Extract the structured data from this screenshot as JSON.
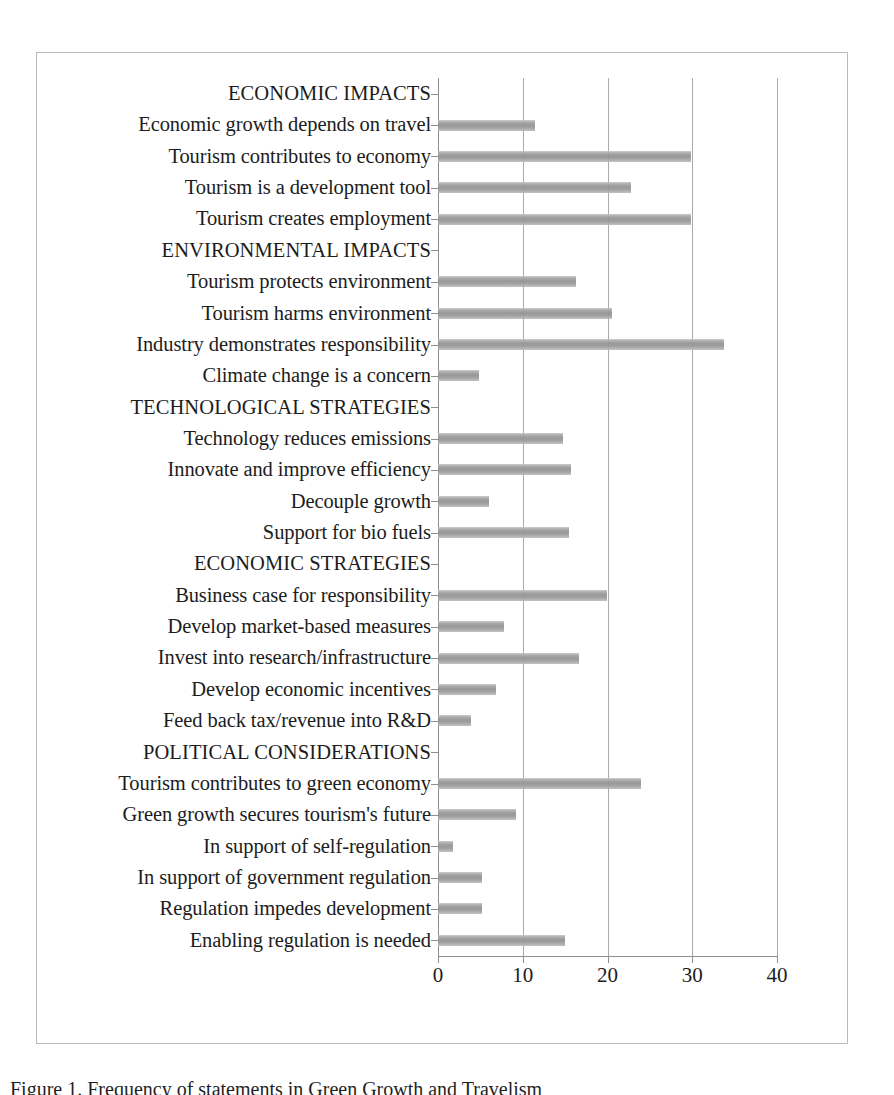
{
  "figure": {
    "caption": "Figure 1. Frequency of statements in Green Growth and Travelism"
  },
  "chart_data": {
    "type": "bar",
    "orientation": "horizontal",
    "title": "",
    "xlabel": "",
    "ylabel": "",
    "xlim": [
      0,
      40
    ],
    "xticks": [
      0,
      10,
      20,
      30,
      40
    ],
    "xtick_labels": [
      "0",
      "10",
      "20",
      "30",
      "40"
    ],
    "grid": true,
    "grid_axis": "x",
    "legend": false,
    "bar_color": "#999999",
    "categories": [
      "ECONOMIC IMPACTS",
      "Economic growth depends on travel",
      "Tourism contributes to economy",
      "Tourism is a development tool",
      "Tourism creates employment",
      "ENVIRONMENTAL IMPACTS",
      "Tourism protects environment",
      "Tourism harms environment",
      "Industry demonstrates responsibility",
      "Climate change is a concern",
      "TECHNOLOGICAL STRATEGIES",
      "Technology reduces emissions",
      "Innovate and improve efficiency",
      "Decouple growth",
      "Support for bio fuels",
      "ECONOMIC STRATEGIES",
      "Business case for responsibility",
      "Develop market-based measures",
      "Invest into research/infrastructure",
      "Develop economic incentives",
      "Feed back tax/revenue into R&D",
      "POLITICAL CONSIDERATIONS",
      "Tourism contributes to green economy",
      "Green growth secures tourism's future",
      "In support of self-regulation",
      "In support of government regulation",
      "Regulation impedes development",
      "Enabling regulation is needed"
    ],
    "values": [
      0,
      11.5,
      29.8,
      22.8,
      29.8,
      0,
      16.3,
      20.5,
      33.8,
      4.8,
      0,
      14.8,
      15.7,
      6.0,
      15.5,
      0,
      19.9,
      7.8,
      16.6,
      6.9,
      3.9,
      0,
      24.0,
      9.2,
      1.8,
      5.2,
      5.2,
      15.0
    ],
    "is_group_header": [
      true,
      false,
      false,
      false,
      false,
      true,
      false,
      false,
      false,
      false,
      true,
      false,
      false,
      false,
      false,
      true,
      false,
      false,
      false,
      false,
      false,
      true,
      false,
      false,
      false,
      false,
      false,
      false
    ],
    "groups": [
      {
        "name": "ECONOMIC IMPACTS",
        "items": [
          {
            "label": "Economic growth depends on travel",
            "value": 11.5
          },
          {
            "label": "Tourism contributes to economy",
            "value": 29.8
          },
          {
            "label": "Tourism is a development tool",
            "value": 22.8
          },
          {
            "label": "Tourism creates employment",
            "value": 29.8
          }
        ]
      },
      {
        "name": "ENVIRONMENTAL IMPACTS",
        "items": [
          {
            "label": "Tourism protects environment",
            "value": 16.3
          },
          {
            "label": "Tourism harms environment",
            "value": 20.5
          },
          {
            "label": "Industry demonstrates responsibility",
            "value": 33.8
          },
          {
            "label": "Climate change is a concern",
            "value": 4.8
          }
        ]
      },
      {
        "name": "TECHNOLOGICAL STRATEGIES",
        "items": [
          {
            "label": "Technology reduces emissions",
            "value": 14.8
          },
          {
            "label": "Innovate and improve efficiency",
            "value": 15.7
          },
          {
            "label": "Decouple growth",
            "value": 6.0
          },
          {
            "label": "Support for bio fuels",
            "value": 15.5
          }
        ]
      },
      {
        "name": "ECONOMIC STRATEGIES",
        "items": [
          {
            "label": "Business case for responsibility",
            "value": 19.9
          },
          {
            "label": "Develop market-based measures",
            "value": 7.8
          },
          {
            "label": "Invest into research/infrastructure",
            "value": 16.6
          },
          {
            "label": "Develop economic incentives",
            "value": 6.9
          },
          {
            "label": "Feed back tax/revenue into R&D",
            "value": 3.9
          }
        ]
      },
      {
        "name": "POLITICAL CONSIDERATIONS",
        "items": [
          {
            "label": "Tourism contributes to green economy",
            "value": 24.0
          },
          {
            "label": "Green growth secures tourism's future",
            "value": 9.2
          },
          {
            "label": "In support of self-regulation",
            "value": 1.8
          },
          {
            "label": "In support of government regulation",
            "value": 5.2
          },
          {
            "label": "Regulation impedes development",
            "value": 5.2
          },
          {
            "label": "Enabling regulation is needed",
            "value": 15.0
          }
        ]
      }
    ]
  }
}
